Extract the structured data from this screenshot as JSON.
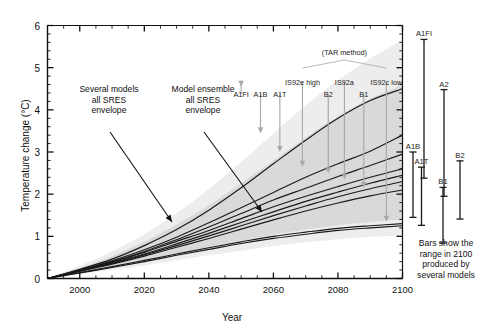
{
  "figure": {
    "title": "",
    "caption_right": "Bars show the\nrange in 2100\nproduced by\nseveral models",
    "caption_right_lines": [
      "Bars show the",
      "range in 2100",
      "produced by",
      "several models"
    ]
  },
  "axes": {
    "y_label": "Temperature change (°C)",
    "x_label": "Year",
    "y_ticks": [
      "0",
      "1",
      "2",
      "3",
      "4",
      "5",
      "6"
    ],
    "x_ticks": [
      "2000",
      "2020",
      "2040",
      "2060",
      "2080",
      "2100"
    ],
    "y_min": 0,
    "y_max": 6,
    "x_min": 1990,
    "x_max": 2100,
    "y_minor_step": 0.2,
    "x_minor_step": 5
  },
  "annotations": [
    {
      "name": "several-models-envelope",
      "lines": [
        "Several models",
        "all SRES",
        "envelope"
      ]
    },
    {
      "name": "model-ensemble-envelope",
      "lines": [
        "Model ensemble",
        "all SRES",
        "envelope"
      ]
    }
  ],
  "tar_method_note": "(TAR method)",
  "scenario_pointers": [
    {
      "label": "A1FI",
      "x_year": 2050,
      "end_value": 4.5
    },
    {
      "label": "A1B",
      "x_year": 2056,
      "end_value": 3.4
    },
    {
      "label": "A1T",
      "x_year": 2062,
      "end_value": 2.95
    },
    {
      "label": "IS92e high",
      "x_year": 2069,
      "end_value": 2.6
    },
    {
      "label": "B2",
      "x_year": 2077,
      "end_value": 2.45
    },
    {
      "label": "IS92a",
      "x_year": 2082,
      "end_value": 2.3
    },
    {
      "label": "B1",
      "x_year": 2088,
      "end_value": 2.1
    },
    {
      "label": "IS92c low",
      "x_year": 2095,
      "end_value": 1.3
    }
  ],
  "range_bars": {
    "note_lines": [
      "Bars show the",
      "range in 2100",
      "produced by",
      "several models"
    ],
    "bars": [
      {
        "label": "A1FI",
        "low": 2.38,
        "high": 5.67
      },
      {
        "label": "A2",
        "low": 1.95,
        "high": 4.48
      },
      {
        "label": "A1B",
        "low": 1.45,
        "high": 3.0
      },
      {
        "label": "A1T",
        "low": 1.26,
        "high": 2.64
      },
      {
        "label": "B1",
        "low": 0.84,
        "high": 2.16
      },
      {
        "label": "B2",
        "low": 1.41,
        "high": 2.79
      }
    ]
  },
  "chart_data": {
    "type": "line",
    "title": "",
    "xlabel": "Year",
    "ylabel": "Temperature change (°C)",
    "xlim": [
      1990,
      2100
    ],
    "ylim": [
      0,
      6
    ],
    "grid": false,
    "legend": "none",
    "x": [
      1990,
      2000,
      2010,
      2020,
      2030,
      2040,
      2050,
      2060,
      2070,
      2080,
      2090,
      2100
    ],
    "series": [
      {
        "name": "A1FI",
        "values": [
          0.0,
          0.22,
          0.46,
          0.78,
          1.16,
          1.62,
          2.15,
          2.72,
          3.28,
          3.8,
          4.22,
          4.5
        ]
      },
      {
        "name": "A1B",
        "values": [
          0.0,
          0.2,
          0.42,
          0.68,
          0.98,
          1.32,
          1.68,
          2.04,
          2.4,
          2.72,
          3.02,
          3.4
        ]
      },
      {
        "name": "A1T",
        "values": [
          0.0,
          0.2,
          0.4,
          0.64,
          0.92,
          1.22,
          1.54,
          1.86,
          2.14,
          2.42,
          2.68,
          2.95
        ]
      },
      {
        "name": "IS92e high",
        "values": [
          0.0,
          0.19,
          0.39,
          0.62,
          0.88,
          1.14,
          1.42,
          1.7,
          1.95,
          2.18,
          2.4,
          2.6
        ]
      },
      {
        "name": "B2",
        "values": [
          0.0,
          0.18,
          0.37,
          0.58,
          0.82,
          1.07,
          1.33,
          1.58,
          1.83,
          2.05,
          2.26,
          2.45
        ]
      },
      {
        "name": "IS92a",
        "values": [
          0.0,
          0.18,
          0.36,
          0.56,
          0.78,
          1.01,
          1.25,
          1.49,
          1.72,
          1.94,
          2.13,
          2.3
        ]
      },
      {
        "name": "B1",
        "values": [
          0.0,
          0.17,
          0.34,
          0.53,
          0.74,
          0.95,
          1.17,
          1.39,
          1.6,
          1.79,
          1.96,
          2.1
        ]
      },
      {
        "name": "IS92c low",
        "values": [
          0.0,
          0.14,
          0.28,
          0.43,
          0.58,
          0.73,
          0.87,
          1.0,
          1.1,
          1.19,
          1.25,
          1.3
        ]
      },
      {
        "name": "lower-pair",
        "values": [
          0.0,
          0.13,
          0.26,
          0.4,
          0.55,
          0.69,
          0.83,
          0.95,
          1.05,
          1.14,
          1.2,
          1.25
        ]
      }
    ],
    "envelopes": [
      {
        "name": "several-models-all-SRES-envelope",
        "color": "#ededed",
        "upper": [
          0.0,
          0.3,
          0.64,
          1.05,
          1.55,
          2.12,
          2.76,
          3.44,
          4.1,
          4.7,
          5.22,
          5.65
        ],
        "lower": [
          0.0,
          0.1,
          0.2,
          0.31,
          0.43,
          0.55,
          0.66,
          0.77,
          0.86,
          0.93,
          0.99,
          1.02
        ]
      },
      {
        "name": "model-ensemble-all-SRES-envelope",
        "color": "#d9d9d9",
        "upper": [
          0.0,
          0.25,
          0.53,
          0.87,
          1.28,
          1.74,
          2.26,
          2.8,
          3.34,
          3.84,
          4.26,
          4.6
        ],
        "lower": [
          0.0,
          0.13,
          0.27,
          0.42,
          0.58,
          0.74,
          0.9,
          1.04,
          1.16,
          1.26,
          1.34,
          1.4
        ]
      }
    ],
    "range_bars_2100": [
      {
        "name": "A1FI",
        "low": 2.38,
        "high": 5.67
      },
      {
        "name": "A2",
        "low": 1.95,
        "high": 4.48
      },
      {
        "name": "A1B",
        "low": 1.45,
        "high": 3.0
      },
      {
        "name": "A1T",
        "low": 1.26,
        "high": 2.64
      },
      {
        "name": "B1",
        "low": 0.84,
        "high": 2.16
      },
      {
        "name": "B2",
        "low": 1.41,
        "high": 2.79
      }
    ]
  }
}
